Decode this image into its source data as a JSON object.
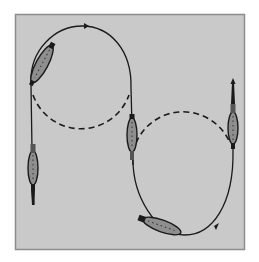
{
  "figure": {
    "colors": {
      "page_background": "#ffffff",
      "panel_background": "#c9c9c9",
      "panel_border": "#8c8c8c",
      "path_stroke": "#1a1a1a",
      "organism_fill": "#8e8e8e",
      "organism_outline": "#1a1a1a"
    },
    "panel": {
      "x": 15,
      "y": 14,
      "width": 230,
      "height": 236
    },
    "loops": [
      {
        "name": "upper-loop",
        "cx": 80,
        "cy": 72,
        "r": 51,
        "solid_half": "top",
        "dashed_half": "bottom"
      },
      {
        "name": "lower-loop",
        "cx": 183,
        "cy": 163,
        "r": 51,
        "solid_half": "bottom",
        "dashed_half": "top"
      }
    ],
    "organisms": [
      {
        "name": "organism-upper-left",
        "position": "upper-left on upper loop"
      },
      {
        "name": "organism-left-descending",
        "position": "left vertical segment"
      },
      {
        "name": "organism-center",
        "position": "center vertical segment between loops"
      },
      {
        "name": "organism-lower",
        "position": "bottom of lower loop"
      },
      {
        "name": "organism-right-ascending",
        "position": "right vertical segment"
      }
    ],
    "arrows": [
      {
        "name": "arrow-top",
        "direction": "right",
        "location": "top of upper loop"
      },
      {
        "name": "arrow-bottom",
        "direction": "right",
        "location": "bottom-right of lower loop"
      }
    ]
  }
}
